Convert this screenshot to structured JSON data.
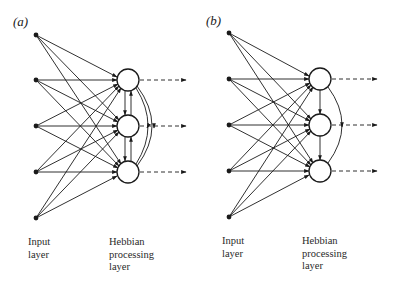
{
  "figure": {
    "panels": [
      {
        "id": "a",
        "label": "(a)",
        "input_label": "Input\nlayer",
        "processing_label": "Hebbian\nprocessing\nlayer",
        "lateral_connections": "symmetric (bidirectional between adjacent neurons, plus long-range arcs between first and last)"
      },
      {
        "id": "b",
        "label": "(b)",
        "input_label": "Input\nlayer",
        "processing_label": "Hebbian\nprocessing\nlayer",
        "lateral_connections": "asymmetric (one-way downward between adjacent neurons, single arc first to last)"
      }
    ],
    "input_nodes_per_panel": 5,
    "processing_nodes_per_panel": 3,
    "connectivity": "fully connected feedforward from input to processing layer",
    "outputs": "dashed arrows from each processing neuron"
  }
}
